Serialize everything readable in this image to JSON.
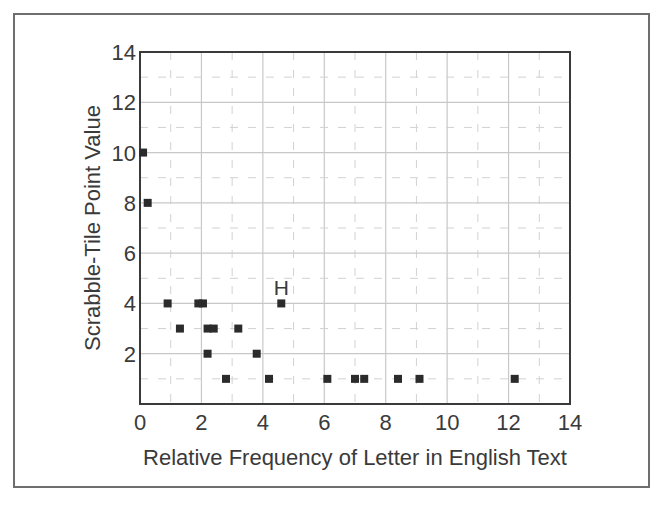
{
  "chart_data": {
    "type": "scatter",
    "title": "",
    "xlabel": "Relative Frequency of Letter in English Text",
    "ylabel": "Scrabble-Tile Point Value",
    "xlim": [
      0,
      14
    ],
    "ylim": [
      0,
      14
    ],
    "xticks": [
      0,
      2,
      4,
      6,
      8,
      10,
      12,
      14
    ],
    "yticks": [
      2,
      4,
      6,
      8,
      10,
      12,
      14
    ],
    "x_tick_labels": [
      "0",
      "2",
      "4",
      "6",
      "8",
      "10",
      "12",
      "14"
    ],
    "y_tick_labels": [
      "2",
      "4",
      "6",
      "8",
      "10",
      "12",
      "14"
    ],
    "grid": {
      "major": "solid at even values",
      "minor": "dashed at odd values"
    },
    "legend": null,
    "series": [
      {
        "name": "letters",
        "marker": "square",
        "color": "#2b2b2b",
        "points": [
          {
            "x": 0.1,
            "y": 10
          },
          {
            "x": 0.25,
            "y": 8
          },
          {
            "x": 0.9,
            "y": 4
          },
          {
            "x": 1.9,
            "y": 4
          },
          {
            "x": 2.05,
            "y": 4
          },
          {
            "x": 4.6,
            "y": 4,
            "label": "H"
          },
          {
            "x": 1.3,
            "y": 3
          },
          {
            "x": 2.2,
            "y": 3
          },
          {
            "x": 2.4,
            "y": 3
          },
          {
            "x": 3.2,
            "y": 3
          },
          {
            "x": 2.2,
            "y": 2
          },
          {
            "x": 3.8,
            "y": 2
          },
          {
            "x": 2.8,
            "y": 1
          },
          {
            "x": 4.2,
            "y": 1
          },
          {
            "x": 6.1,
            "y": 1
          },
          {
            "x": 7.0,
            "y": 1
          },
          {
            "x": 7.3,
            "y": 1
          },
          {
            "x": 8.4,
            "y": 1
          },
          {
            "x": 9.1,
            "y": 1
          },
          {
            "x": 12.2,
            "y": 1
          }
        ]
      }
    ],
    "annotations": [
      {
        "text": "H",
        "x": 4.6,
        "y": 4
      }
    ]
  },
  "labels": {
    "xlabel": "Relative Frequency of Letter in English Text",
    "ylabel": "Scrabble-Tile Point Value",
    "annotation_h": "H"
  }
}
